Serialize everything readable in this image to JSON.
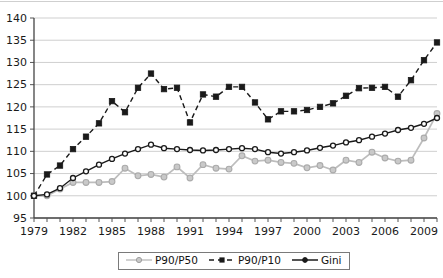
{
  "chart_data": {
    "type": "line",
    "title": "",
    "subtitle": "",
    "xlabel": "",
    "ylabel": "",
    "xlim": [
      1979,
      2010
    ],
    "ylim": [
      95,
      140
    ],
    "ytick_step": 5,
    "yticks": [
      95,
      100,
      105,
      110,
      115,
      120,
      125,
      130,
      135,
      140
    ],
    "x": [
      1979,
      1980,
      1981,
      1982,
      1983,
      1984,
      1985,
      1986,
      1987,
      1988,
      1989,
      1990,
      1991,
      1992,
      1993,
      1994,
      1995,
      1996,
      1997,
      1998,
      1999,
      2000,
      2001,
      2002,
      2003,
      2004,
      2005,
      2006,
      2007,
      2008,
      2009,
      2010
    ],
    "xticks_labeled": [
      1979,
      1982,
      1985,
      1988,
      1991,
      1994,
      1997,
      2000,
      2003,
      2006,
      2009
    ],
    "grid": "horizontal",
    "legend_position": "bottom-center",
    "series": [
      {
        "name": "P90/P50",
        "color": "#bdbdbd",
        "marker": "circle",
        "linestyle": "solid",
        "values": [
          100.0,
          100.0,
          101.5,
          103.0,
          103.0,
          103.0,
          103.2,
          106.2,
          104.5,
          104.8,
          104.2,
          106.5,
          104.0,
          107.0,
          106.2,
          106.0,
          109.0,
          107.8,
          108.0,
          107.5,
          107.3,
          106.3,
          106.8,
          105.8,
          108.0,
          107.5,
          109.8,
          108.5,
          107.8,
          108.0,
          113.0,
          118.5
        ]
      },
      {
        "name": "P90/P10",
        "color": "#1a1a1a",
        "marker": "square",
        "linestyle": "dashed",
        "values": [
          100.0,
          104.8,
          106.8,
          110.5,
          113.3,
          116.3,
          121.3,
          118.8,
          124.3,
          127.5,
          124.0,
          124.3,
          116.5,
          122.8,
          122.3,
          124.5,
          124.5,
          121.0,
          117.2,
          119.0,
          119.0,
          119.3,
          120.0,
          120.8,
          122.5,
          124.2,
          124.3,
          124.5,
          122.3,
          126.0,
          130.5,
          134.5
        ]
      },
      {
        "name": "Gini",
        "color": "#1a1a1a",
        "marker": "circle",
        "linestyle": "solid",
        "values": [
          100.0,
          100.3,
          101.7,
          104.0,
          105.5,
          107.0,
          108.3,
          109.5,
          110.5,
          111.5,
          110.7,
          110.5,
          110.3,
          110.2,
          110.3,
          110.5,
          110.7,
          110.5,
          109.8,
          109.5,
          109.8,
          110.2,
          110.8,
          111.3,
          112.0,
          112.5,
          113.3,
          114.0,
          114.8,
          115.3,
          116.2,
          117.5
        ]
      }
    ]
  },
  "legend": {
    "items": [
      {
        "label": "P90/P50"
      },
      {
        "label": "P90/P10"
      },
      {
        "label": "Gini"
      }
    ]
  },
  "axis": {
    "y_labels": [
      "140",
      "135",
      "130",
      "125",
      "120",
      "115",
      "110",
      "105",
      "100",
      "95"
    ],
    "x_labels": [
      "1979",
      "1982",
      "1985",
      "1988",
      "1991",
      "1994",
      "1997",
      "2000",
      "2003",
      "2006",
      "2009"
    ]
  },
  "colors": {
    "series_light": "#bdbdbd",
    "series_dark": "#1a1a1a",
    "grid": "#cccccc",
    "axis": "#555555",
    "background": "#ffffff"
  }
}
